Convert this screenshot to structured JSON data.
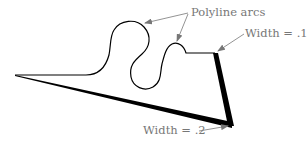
{
  "diagram": {
    "labels": {
      "polyline_arcs": "Polyline arcs",
      "width_top": "Width = .1",
      "width_bottom": "Width = .2"
    },
    "colors": {
      "stroke": "#000000",
      "annotation": "#777777",
      "background": "#ffffff"
    }
  }
}
